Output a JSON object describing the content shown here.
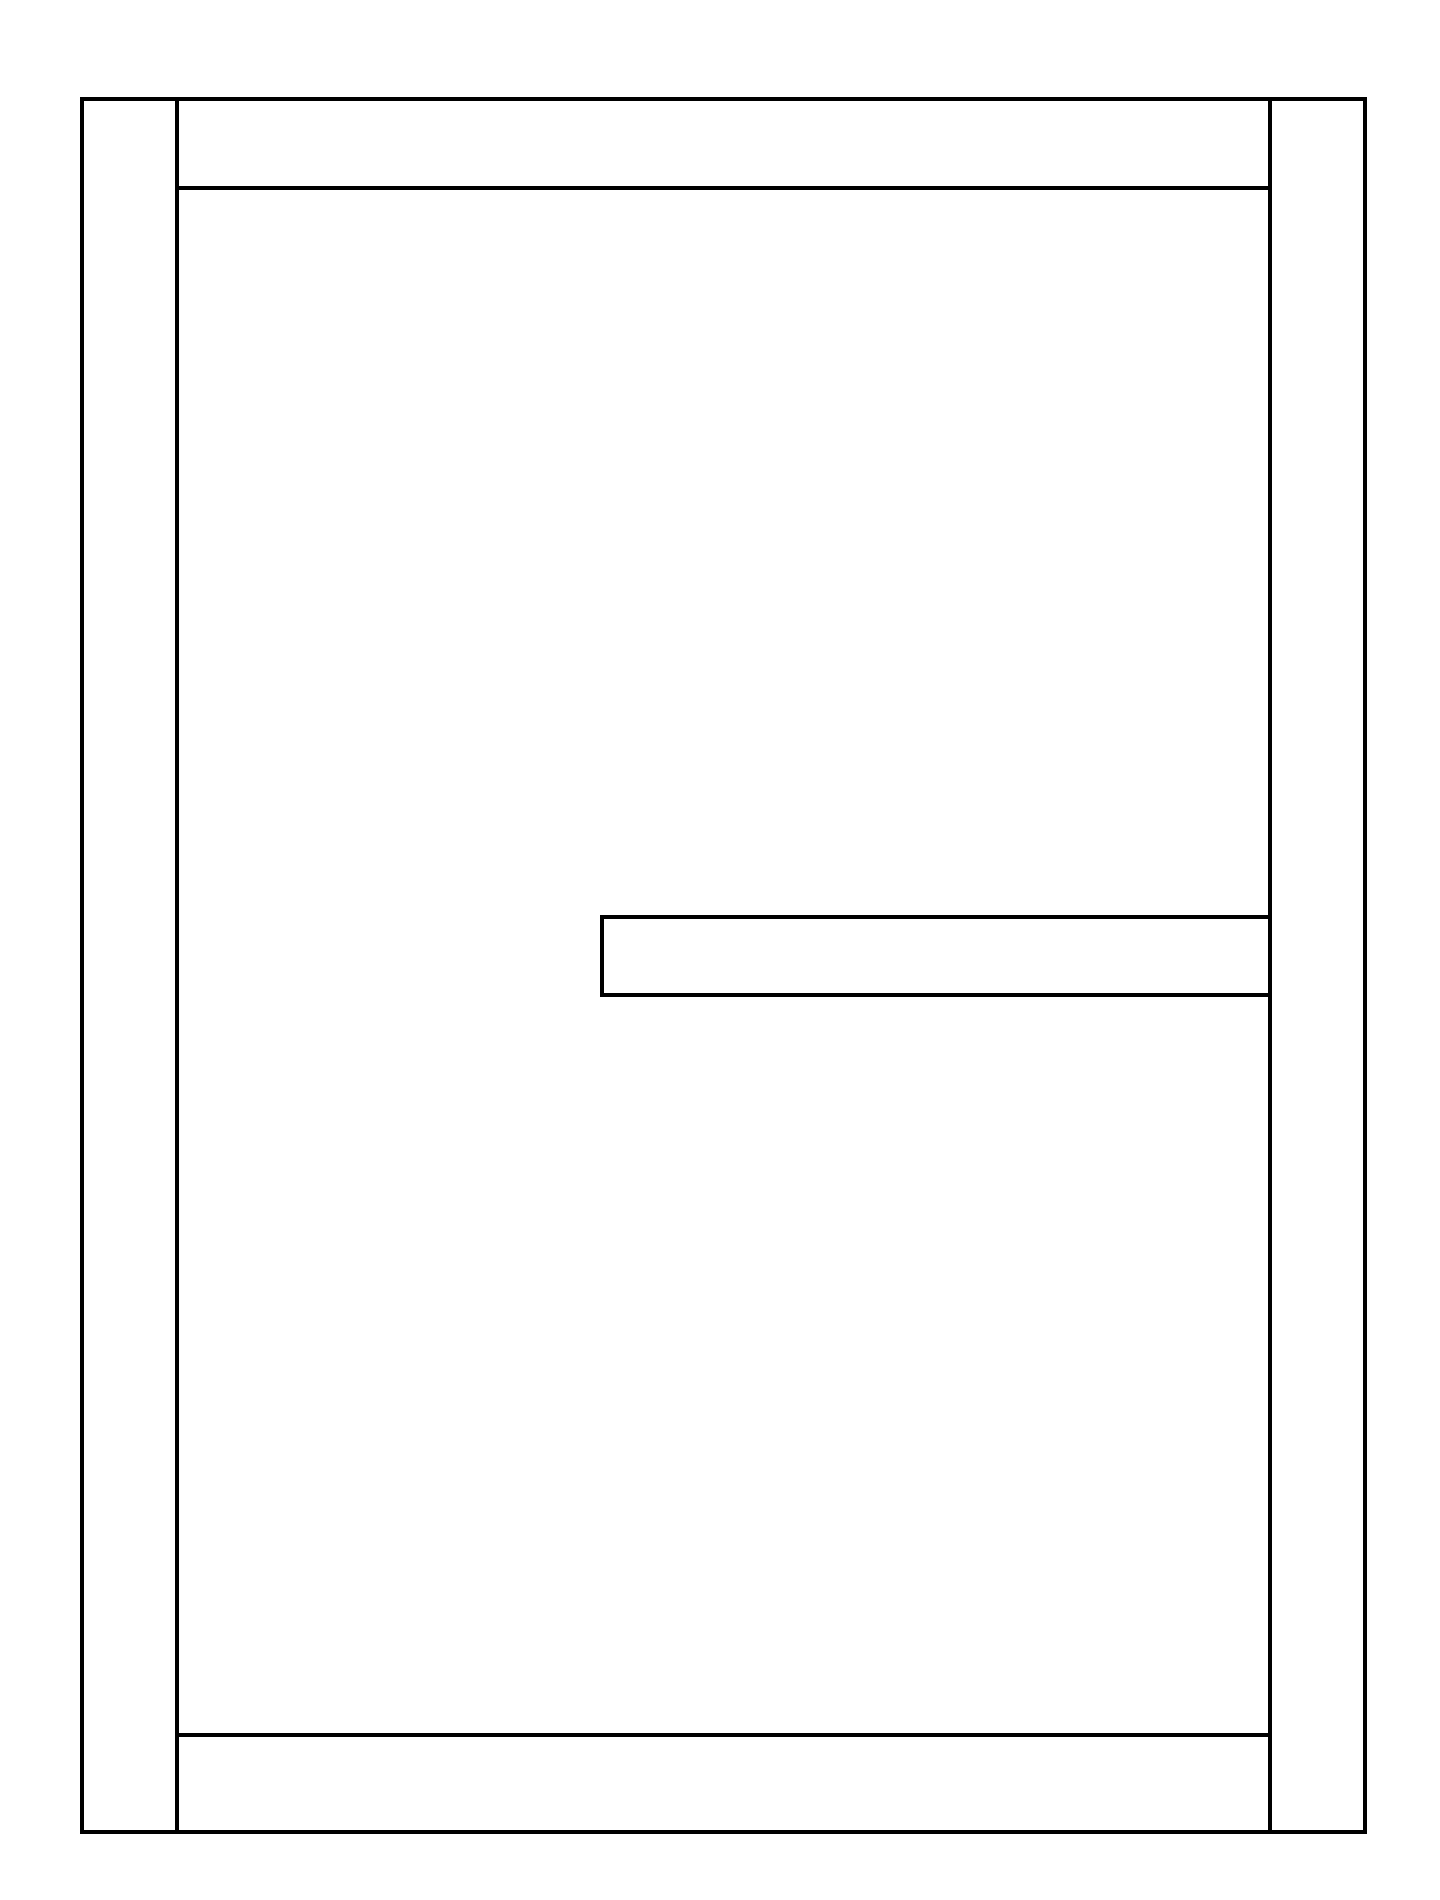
{
  "diagram": {
    "kind": "hand-drawn wireframe",
    "stroke_color": "#000000",
    "background_color": "#ffffff",
    "regions": [
      {
        "id": "outer-frame",
        "label": "",
        "x": 80,
        "y": 97,
        "w": 1287,
        "h": 1737
      },
      {
        "id": "left-column",
        "label": "",
        "x": 80,
        "y": 97,
        "w": 99,
        "h": 1737
      },
      {
        "id": "right-column",
        "label": "",
        "x": 1266,
        "y": 97,
        "w": 101,
        "h": 1737
      },
      {
        "id": "header-band",
        "label": "",
        "x": 177,
        "y": 97,
        "w": 1091,
        "h": 93
      },
      {
        "id": "footer-band",
        "label": "",
        "x": 170,
        "y": 1735,
        "w": 1098,
        "h": 99
      },
      {
        "id": "middle-bar",
        "label": "",
        "x": 600,
        "y": 915,
        "w": 670,
        "h": 82
      }
    ],
    "text": []
  }
}
